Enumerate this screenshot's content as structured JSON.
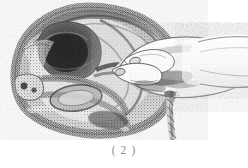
{
  "figure": {
    "caption": "( 2 )",
    "caption_number": "2",
    "background_color": "#ffffff",
    "ink_color": "#3a3a3a",
    "caption_color": "#8e8e8e",
    "media": "halftone scanned line-and-tone illustration"
  },
  "illustration": {
    "title": "Obstetric procedure illustration, figure 2",
    "viewbox": "0 0 248 140",
    "elements": [
      {
        "name": "pelvic-cross-section",
        "label": "Pelvic / uterine sagittal section",
        "description": "Large rounded mass occupying the left two thirds of the image, rendered in dense stipple with a dark interior cavity.",
        "bounds": {
          "x": 14,
          "y": 6,
          "w": 160,
          "h": 128
        }
      },
      {
        "name": "uterine-cavity",
        "label": "Dark interior cavity",
        "description": "Deep shadowed hollow near the upper left of the section.",
        "bounds": {
          "x": 38,
          "y": 24,
          "w": 62,
          "h": 52
        }
      },
      {
        "name": "lower-pelvic-structures",
        "label": "Lower pelvic structures",
        "description": "Stacked curved bands and a coiled loop below the cavity.",
        "bounds": {
          "x": 16,
          "y": 72,
          "w": 110,
          "h": 58
        }
      },
      {
        "name": "operator-hand",
        "label": "Operator's hand",
        "description": "Hand entering from the right, thumb and index finger pinching tissue at the centre.",
        "bounds": {
          "x": 108,
          "y": 38,
          "w": 108,
          "h": 62
        }
      },
      {
        "name": "operator-forearm",
        "label": "Operator's forearm and wrist",
        "description": "Forearm running off the right edge of the frame.",
        "bounds": {
          "x": 176,
          "y": 34,
          "w": 72,
          "h": 56
        }
      },
      {
        "name": "umbilical-cord",
        "label": "Twisted umbilical cord",
        "description": "Narrow spiral-twisted cord hanging vertically below the wrist.",
        "bounds": {
          "x": 166,
          "y": 92,
          "w": 16,
          "h": 52
        }
      },
      {
        "name": "grasped-tissue",
        "label": "Grasped tissue strand",
        "description": "Dark horizontal strand held between the fingertips at the centre of the field.",
        "bounds": {
          "x": 96,
          "y": 62,
          "w": 48,
          "h": 16
        }
      }
    ]
  }
}
